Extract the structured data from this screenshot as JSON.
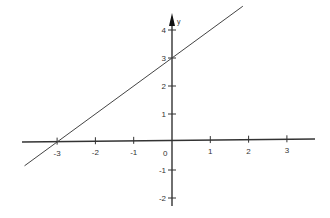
{
  "chart_data": {
    "type": "line",
    "title": "",
    "xlabel": "",
    "ylabel": "y",
    "xlim": [
      -3.9,
      3.7
    ],
    "ylim": [
      -2.4,
      5.0
    ],
    "x_ticks": [
      -3,
      -2,
      -1,
      1,
      2,
      3
    ],
    "y_ticks": [
      4,
      3,
      2,
      1,
      -1,
      -2
    ],
    "origin_label": "0",
    "grid": false,
    "legend": "none",
    "series": [
      {
        "name": "y = x + 3",
        "slope": 1,
        "intercept": 3,
        "x": [
          -3.85,
          1.85
        ],
        "y": [
          -0.85,
          4.85
        ]
      }
    ],
    "colors": {
      "axis": "#333333",
      "line": "#444444"
    }
  }
}
